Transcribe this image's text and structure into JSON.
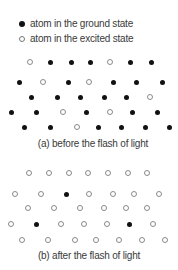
{
  "legend": {
    "ground": {
      "icon": "filled-circle-icon",
      "label": "atom in the ground state"
    },
    "excited": {
      "icon": "open-circle-icon",
      "label": "atom in the excited state"
    }
  },
  "diagrams": [
    {
      "id": "a",
      "caption": "(a) before the flash of light",
      "rows": [
        {
          "y": 62,
          "atoms": [
            [
              30,
              "excited"
            ],
            [
              50,
              "ground"
            ],
            [
              71,
              "ground"
            ],
            [
              90,
              "ground"
            ],
            [
              110,
              "excited"
            ],
            [
              130,
              "ground"
            ],
            [
              151,
              "ground"
            ]
          ]
        },
        {
          "y": 82,
          "atoms": [
            [
              19,
              "ground"
            ],
            [
              43,
              "excited"
            ],
            [
              68,
              "ground"
            ],
            [
              89,
              "excited"
            ],
            [
              113,
              "ground"
            ],
            [
              136,
              "ground"
            ],
            [
              162,
              "ground"
            ]
          ]
        },
        {
          "y": 97,
          "atoms": [
            [
              31,
              "ground"
            ],
            [
              57,
              "ground"
            ],
            [
              80,
              "ground"
            ],
            [
              104,
              "ground"
            ],
            [
              126,
              "ground"
            ],
            [
              150,
              "excited"
            ]
          ]
        },
        {
          "y": 112,
          "atoms": [
            [
              11,
              "ground"
            ],
            [
              36,
              "ground"
            ],
            [
              63,
              "excited"
            ],
            [
              86,
              "ground"
            ],
            [
              110,
              "excited"
            ],
            [
              132,
              "ground"
            ],
            [
              157,
              "ground"
            ]
          ]
        },
        {
          "y": 127,
          "atoms": [
            [
              24,
              "ground"
            ],
            [
              50,
              "ground"
            ],
            [
              77,
              "excited"
            ],
            [
              98,
              "ground"
            ],
            [
              121,
              "ground"
            ],
            [
              145,
              "ground"
            ],
            [
              169,
              "ground"
            ]
          ]
        }
      ]
    },
    {
      "id": "b",
      "caption": "(b) after the flash of light",
      "rows": [
        {
          "y": 173,
          "atoms": [
            [
              29,
              "excited"
            ],
            [
              49,
              "excited"
            ],
            [
              69,
              "excited"
            ],
            [
              88,
              "excited"
            ],
            [
              108,
              "excited"
            ],
            [
              128,
              "excited"
            ],
            [
              147,
              "excited"
            ]
          ]
        },
        {
          "y": 194,
          "atoms": [
            [
              15,
              "excited"
            ],
            [
              41,
              "excited"
            ],
            [
              66,
              "ground"
            ],
            [
              89,
              "excited"
            ],
            [
              113,
              "excited"
            ],
            [
              134,
              "excited"
            ],
            [
              159,
              "excited"
            ]
          ]
        },
        {
          "y": 208,
          "atoms": [
            [
              28,
              "excited"
            ],
            [
              54,
              "excited"
            ],
            [
              80,
              "excited"
            ],
            [
              104,
              "excited"
            ],
            [
              126,
              "excited"
            ],
            [
              147,
              "excited"
            ]
          ]
        },
        {
          "y": 224,
          "atoms": [
            [
              11,
              "excited"
            ],
            [
              36,
              "ground"
            ],
            [
              61,
              "excited"
            ],
            [
              84,
              "excited"
            ],
            [
              107,
              "excited"
            ],
            [
              129,
              "ground"
            ],
            [
              153,
              "excited"
            ]
          ]
        },
        {
          "y": 240,
          "atoms": [
            [
              22,
              "excited"
            ],
            [
              48,
              "excited"
            ],
            [
              75,
              "excited"
            ],
            [
              96,
              "excited"
            ],
            [
              119,
              "excited"
            ],
            [
              142,
              "excited"
            ],
            [
              165,
              "excited"
            ]
          ]
        }
      ]
    }
  ],
  "colors": {
    "ground_fill": "#111111",
    "excited_stroke": "#8a8a8a",
    "text": "#3a3a3a"
  }
}
